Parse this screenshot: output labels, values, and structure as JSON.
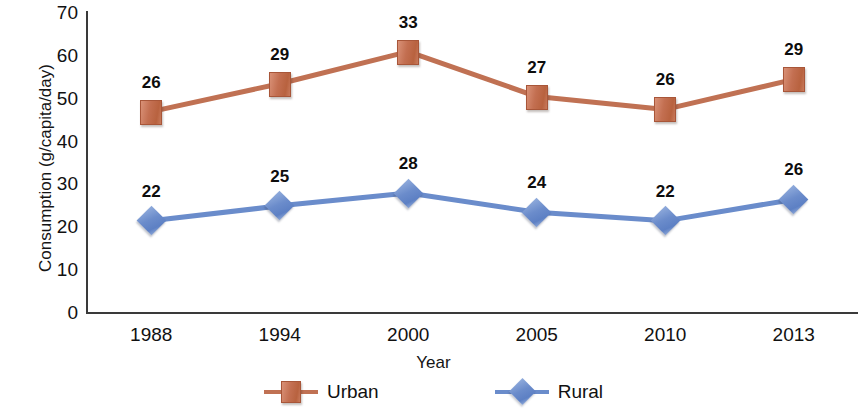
{
  "chart_data": {
    "type": "line",
    "title": "",
    "xlabel": "Year",
    "ylabel": "Consumption (g/capita/day)",
    "categories": [
      "1988",
      "1994",
      "2000",
      "2005",
      "2010",
      "2013"
    ],
    "ylim": [
      0,
      70
    ],
    "yticks": [
      "0",
      "10",
      "20",
      "30",
      "40",
      "50",
      "60",
      "70"
    ],
    "grid": false,
    "legend_position": "bottom",
    "series": [
      {
        "name": "Urban",
        "color": "#c07153",
        "marker": "square",
        "labels": [
          "26",
          "29",
          "33",
          "27",
          "26",
          "29"
        ],
        "values": [
          26,
          29,
          33,
          27,
          26,
          29
        ],
        "plotted_values": [
          47,
          53.5,
          61,
          50.5,
          47.5,
          54.5
        ]
      },
      {
        "name": "Rural",
        "color": "#6a8ccb",
        "marker": "diamond",
        "labels": [
          "22",
          "25",
          "28",
          "24",
          "22",
          "26"
        ],
        "values": [
          22,
          25,
          28,
          24,
          22,
          26
        ],
        "plotted_values": [
          21.5,
          25,
          28,
          23.5,
          21.5,
          26.5
        ]
      }
    ]
  },
  "legend": {
    "items": [
      {
        "label": "Urban",
        "marker": "square-marker"
      },
      {
        "label": "Rural",
        "marker": "diamond-marker"
      }
    ]
  }
}
